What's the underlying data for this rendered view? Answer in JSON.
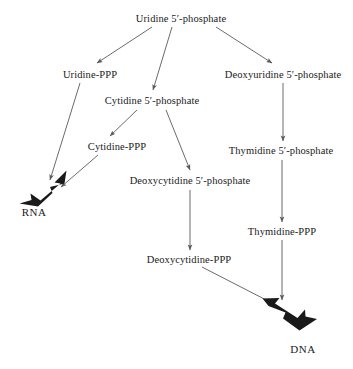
{
  "diagram": {
    "background_color": "#ffffff",
    "text_color": "#1a1a1a",
    "arrow_color": "#555555",
    "bold_arrow_color": "#1a1a1a",
    "nodes": [
      {
        "id": "uridine-5-phosphate",
        "label": "Uridine 5′-phosphate",
        "x": 181,
        "y": 19
      },
      {
        "id": "uridine-ppp",
        "label": "Uridine-PPP",
        "x": 90,
        "y": 75
      },
      {
        "id": "deoxyuridine-5-phosphate",
        "label": "Deoxyuridine 5′-phosphate",
        "x": 283,
        "y": 75
      },
      {
        "id": "cytidine-5-phosphate",
        "label": "Cytidine 5′-phosphate",
        "x": 152,
        "y": 101
      },
      {
        "id": "cytidine-ppp",
        "label": "Cytidine-PPP",
        "x": 117,
        "y": 147
      },
      {
        "id": "thymidine-5-phosphate",
        "label": "Thymidine 5′-phosphate",
        "x": 281,
        "y": 151
      },
      {
        "id": "deoxycytidine-5-phosphate",
        "label": "Deoxycytidine 5′-phosphate",
        "x": 190,
        "y": 181
      },
      {
        "id": "thymidine-ppp",
        "label": "Thymidine-PPP",
        "x": 282,
        "y": 232
      },
      {
        "id": "deoxycytidine-ppp",
        "label": "Deoxycytidine-PPP",
        "x": 189,
        "y": 260
      },
      {
        "id": "rna",
        "label": "RNA",
        "x": 34,
        "y": 212
      },
      {
        "id": "dna",
        "label": "DNA",
        "x": 303,
        "y": 349
      }
    ],
    "edges": [
      {
        "id": "uridine-to-uridine-ppp",
        "from": "uridine-5-phosphate",
        "to": "uridine-ppp",
        "style": "thin"
      },
      {
        "id": "uridine-to-cytidine",
        "from": "uridine-5-phosphate",
        "to": "cytidine-5-phosphate",
        "style": "thin"
      },
      {
        "id": "uridine-to-deoxyuridine",
        "from": "uridine-5-phosphate",
        "to": "deoxyuridine-5-phosphate",
        "style": "thin"
      },
      {
        "id": "uridine-ppp-to-rna",
        "from": "uridine-ppp",
        "to": "rna",
        "style": "thin"
      },
      {
        "id": "cytidine-to-cytidine-ppp",
        "from": "cytidine-5-phosphate",
        "to": "cytidine-ppp",
        "style": "thin"
      },
      {
        "id": "cytidine-to-deoxycytidine",
        "from": "cytidine-5-phosphate",
        "to": "deoxycytidine-5-phosphate",
        "style": "thin"
      },
      {
        "id": "cytidine-ppp-to-rna",
        "from": "cytidine-ppp",
        "to": "rna",
        "style": "thin"
      },
      {
        "id": "deoxyuridine-to-thymidine",
        "from": "deoxyuridine-5-phosphate",
        "to": "thymidine-5-phosphate",
        "style": "thin"
      },
      {
        "id": "thymidine-to-thymidine-ppp",
        "from": "thymidine-5-phosphate",
        "to": "thymidine-ppp",
        "style": "thin"
      },
      {
        "id": "deoxycytidine-to-deoxycytidine-ppp",
        "from": "deoxycytidine-5-phosphate",
        "to": "deoxycytidine-ppp",
        "style": "thin"
      },
      {
        "id": "thymidine-ppp-to-dna",
        "from": "thymidine-ppp",
        "to": "dna",
        "style": "thin"
      },
      {
        "id": "deoxycytidine-ppp-to-dna",
        "from": "deoxycytidine-ppp",
        "to": "dna",
        "style": "thin"
      },
      {
        "id": "bold-arrow-rna",
        "from": "pathway",
        "to": "rna",
        "style": "bold"
      },
      {
        "id": "bold-arrow-dna",
        "from": "pathway",
        "to": "dna",
        "style": "bold"
      }
    ]
  }
}
